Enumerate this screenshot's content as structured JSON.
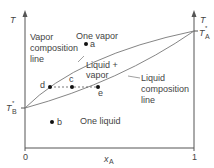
{
  "diagram": {
    "type": "phase-diagram",
    "axes": {
      "left_label": "T",
      "right_label": "T",
      "x_label": "x",
      "x_label_sub": "A",
      "x_tick_min": "0",
      "x_tick_max": "1",
      "left_tick": "T",
      "left_tick_sub": "B",
      "left_tick_sup": "*",
      "right_tick": "T",
      "right_tick_sub": "A",
      "right_tick_sup": "*"
    },
    "regions": {
      "vapor": "One vapor",
      "two_phase_line1": "Liquid +",
      "two_phase_line2": "vapor",
      "liquid": "One liquid"
    },
    "curves": {
      "vapor_line1": "Vapor",
      "vapor_line2": "composition",
      "vapor_line3": "line",
      "liquid_line1": "Liquid",
      "liquid_line2": "composition",
      "liquid_line3": "line"
    },
    "points": {
      "a": "a",
      "b": "b",
      "c": "c",
      "d": "d",
      "e": "e"
    },
    "colors": {
      "line": "#666666",
      "text": "#444444",
      "point": "#111111"
    }
  }
}
